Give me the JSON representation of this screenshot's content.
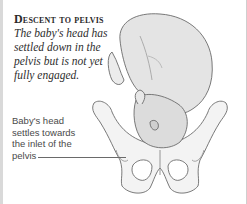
{
  "heading": "Descent to pelvis",
  "caption": "The baby's head has settled down in the pelvis but is not yet fully engaged.",
  "annotation": {
    "label": "Baby's head settles towards the inlet of the pelvis"
  },
  "illustration": {
    "subject": "fetus-head-down-above-pelvis",
    "colors": {
      "outline": "#6b6b6b",
      "fill": "#f2f2f2",
      "shade": "#d0d0d0"
    }
  }
}
